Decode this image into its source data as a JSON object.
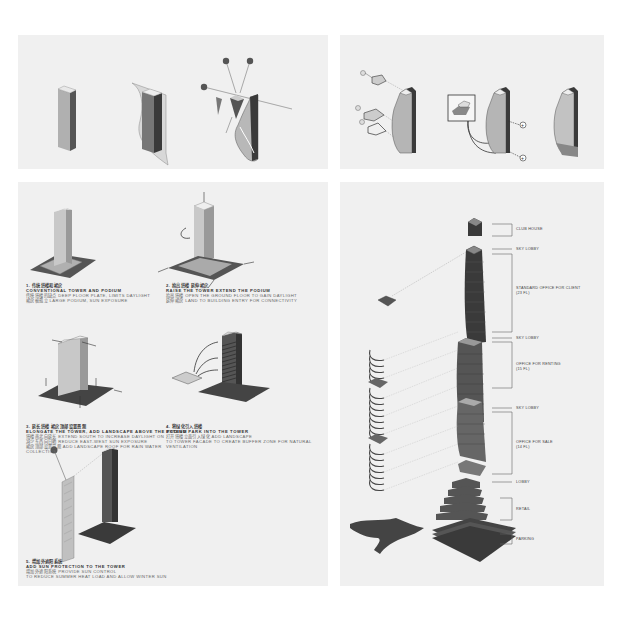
{
  "panels": {
    "top_left": {
      "title": "Tower massing sequence",
      "steps": [
        "box tower",
        "wrapped facade",
        "sun-angle shaping"
      ]
    },
    "top_right": {
      "title": "Sky lobby / podium assembly",
      "steps": [
        "exploded floor plates",
        "connection detail",
        "final tower"
      ]
    },
    "bottom_left": {
      "captions": [
        {
          "number": "1.",
          "cn": "1. 传统塔楼和裙房",
          "en": "CONVENTIONAL TOWER AND PODIUM",
          "desc1": "传统塔楼的缺点 DEEP FLOOR PLATE, LIMITS DAYLIGHT",
          "desc2": "裙房被孤立 LARGE PODIUM, SUN EXPOSURE"
        },
        {
          "number": "2.",
          "cn": "2. 抬高塔楼 延伸裙房",
          "en": "RAISE THE TOWER EXTEND THE PODIUM",
          "desc1": "抬高塔楼 OPEN THE GROUND FLOOR TO GAIN DAYLIGHT",
          "desc2": "延伸裙房 LAND TO BUILDING ENTRY FOR CONNECTIVITY"
        },
        {
          "number": "3.",
          "cn": "3. 延长塔楼 裙房顶部设置景观",
          "en": "ELONGATE THE TOWER, ADD LANDSCAPE ABOVE THE PODIUM",
          "desc1": "塔楼南北向延长 EXTEND SOUTH TO INCREASE DAYLIGHT ON",
          "desc2": "减少东西向日晒 REDUCE EAST-WEST SUN EXPOSURE",
          "desc3": "裙房顶部设置景观 ADD LANDSCAPE ROOF FOR RAIN WATER",
          "desc4": "COLLECTION"
        },
        {
          "number": "4.",
          "cn": "4. 将绿化引入塔楼",
          "en": "EXTEND PARK INTO THE TOWER",
          "desc1": "打开塔楼立面引入绿化 ADD LANDSCAPE",
          "desc2": "TO TOWER FACADE TO CREATE BUFFER ZONE FOR NATURAL",
          "desc3": "VENTILATION"
        },
        {
          "number": "5.",
          "cn": "5. 增加外遮阳系统",
          "en": "ADD SUN PROTECTION TO THE TOWER",
          "desc1": "增加外遮阳系统 PROVIDE SUN CONTROL",
          "desc2": "TO REDUCE SUMMER HEAT LOAD AND ALLOW WINTER SUN"
        }
      ]
    },
    "bottom_right": {
      "labels": [
        {
          "text": "CLUB HOUSE"
        },
        {
          "text": "SKY LOBBY"
        },
        {
          "text": "STANDARD OFFICE FOR CLIENT",
          "sub": "(23 FL)"
        },
        {
          "text": "SKY LOBBY"
        },
        {
          "text": "OFFICE FOR RENTING",
          "sub": "(15 FL)"
        },
        {
          "text": "SKY LOBBY"
        },
        {
          "text": "OFFICE FOR SALE",
          "sub": "(14 FL)"
        },
        {
          "text": "LOBBY"
        },
        {
          "text": "RETAIL"
        },
        {
          "text": "PARKING"
        }
      ]
    }
  },
  "colors": {
    "page_bg": "#ffffff",
    "panel_bg": "#f0f0f0",
    "mass_dark": "#3a3a3a",
    "mass_mid": "#7a7a7a",
    "mass_light": "#c8c8c8",
    "accent_dot": "#555555"
  }
}
